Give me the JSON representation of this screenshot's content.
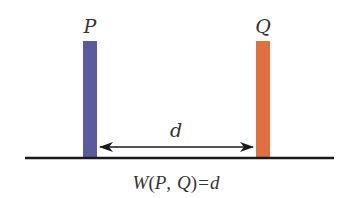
{
  "diagram": {
    "labels": {
      "p": "P",
      "q": "Q",
      "distance": "d"
    },
    "formula": {
      "w": "W",
      "open": "(",
      "p": "P",
      "comma": ",",
      "q": "Q",
      "close": ")",
      "eq": "=",
      "d": "d"
    },
    "colors": {
      "p_bar": "#5a5a9c",
      "q_bar": "#e0703f",
      "baseline": "#1a1a1a",
      "arrow": "#1a1a1a",
      "text": "#333333"
    }
  }
}
